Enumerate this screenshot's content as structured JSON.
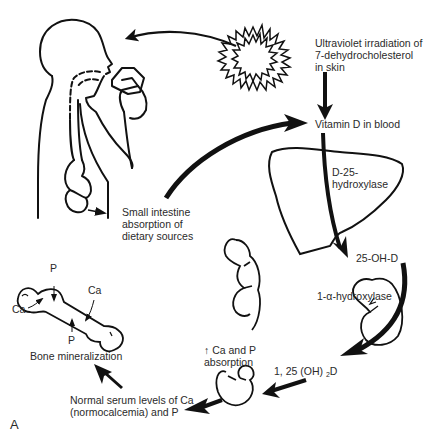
{
  "figure": {
    "panel_label": "A",
    "nodes": {
      "uv": "Ultraviolet irradiation of\n7-dehydrocholesterol\nin skin",
      "vitd_blood": "Vitamin D in blood",
      "liver_enzyme": "D-25-\nhydroxylase",
      "metabolite_25": "25-OH-D",
      "kidney_enzyme": "1-α-hydroxylase",
      "calcitriol_prefix": "1, 25 (OH) ",
      "calcitriol_sub": "2",
      "calcitriol_suffix": "D",
      "gut_absorption": "↑ Ca and P\nabsorption",
      "serum": "Normal serum levels of Ca\n(normocalcemia) and P",
      "bone": "Bone mineralization",
      "small_intestine": "Small intestine\nabsorption of\ndietary sources"
    },
    "bone_labels": {
      "p_top": "P",
      "p_bottom": "P",
      "ca_left": "Ca",
      "ca_right": "Ca"
    },
    "flow": [
      "Ultraviolet irradiation of 7-dehydrocholesterol in skin -> Vitamin D in blood",
      "Small intestine absorption of dietary sources -> Vitamin D in blood",
      "Vitamin D in blood -> (liver: D-25-hydroxylase) -> 25-OH-D",
      "25-OH-D -> (kidney: 1-α-hydroxylase) -> 1, 25 (OH)2D",
      "1, 25 (OH)2D -> intestine: ↑ Ca and P absorption",
      "↑ Ca and P absorption -> Normal serum levels of Ca (normocalcemia) and P",
      "Normal serum levels -> Bone mineralization"
    ],
    "colors": {
      "ink": "#111111",
      "text": "#2a2a2a",
      "background": "#ffffff"
    }
  }
}
